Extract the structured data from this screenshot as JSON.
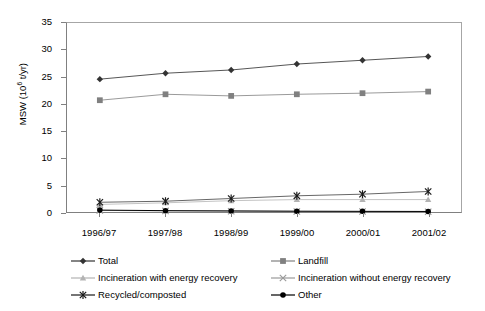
{
  "chart_data": {
    "type": "line",
    "title": "",
    "xlabel": "",
    "ylabel": "MSW (10^6 t/yr)",
    "ylabel_prefix": "MSW (10",
    "ylabel_exponent": "6",
    "ylabel_suffix": " t/yr)",
    "categories": [
      "1996/97",
      "1997/98",
      "1998/99",
      "1999/00",
      "2000/01",
      "2001/02"
    ],
    "ylim": [
      0,
      35
    ],
    "yticks": [
      0,
      5,
      10,
      15,
      20,
      25,
      30,
      35
    ],
    "grid": false,
    "legend_position": "below",
    "series": [
      {
        "name": "Total",
        "marker": "diamond",
        "color": "#333333",
        "line_color": "#555555",
        "values": [
          24.6,
          25.7,
          26.3,
          27.4,
          28.1,
          28.8
        ]
      },
      {
        "name": "Landfill",
        "marker": "square",
        "color": "#808080",
        "line_color": "#999999",
        "values": [
          20.7,
          21.8,
          21.5,
          21.8,
          22.0,
          22.3
        ]
      },
      {
        "name": "Incineration with energy recovery",
        "marker": "triangle",
        "color": "#b3b3b3",
        "line_color": "#c4c4c4",
        "values": [
          1.4,
          1.7,
          2.1,
          2.3,
          2.3,
          2.3
        ]
      },
      {
        "name": "Incineration without energy recovery",
        "marker": "cross",
        "color": "#999999",
        "line_color": "#aaaaaa",
        "values": [
          0.3,
          0.2,
          0.15,
          0.1,
          0.08,
          0.05
        ]
      },
      {
        "name": "Recycled/composted",
        "marker": "asterisk",
        "color": "#1a1a1a",
        "line_color": "#666666",
        "values": [
          1.8,
          2.0,
          2.5,
          3.0,
          3.3,
          3.8
        ]
      },
      {
        "name": "Other",
        "marker": "circle",
        "color": "#000000",
        "line_color": "#000000",
        "values": [
          0.35,
          0.25,
          0.2,
          0.15,
          0.12,
          0.1
        ]
      }
    ]
  },
  "legend": {
    "items": [
      {
        "label": "Total",
        "marker": "diamond",
        "color": "#333333"
      },
      {
        "label": "Landfill",
        "marker": "square",
        "color": "#808080"
      },
      {
        "label": "Incineration with energy recovery",
        "marker": "triangle",
        "color": "#b3b3b3"
      },
      {
        "label": "Incineration without energy recovery",
        "marker": "cross",
        "color": "#999999"
      },
      {
        "label": "Recycled/composted",
        "marker": "asterisk",
        "color": "#1a1a1a"
      },
      {
        "label": "Other",
        "marker": "circle",
        "color": "#000000"
      }
    ]
  }
}
